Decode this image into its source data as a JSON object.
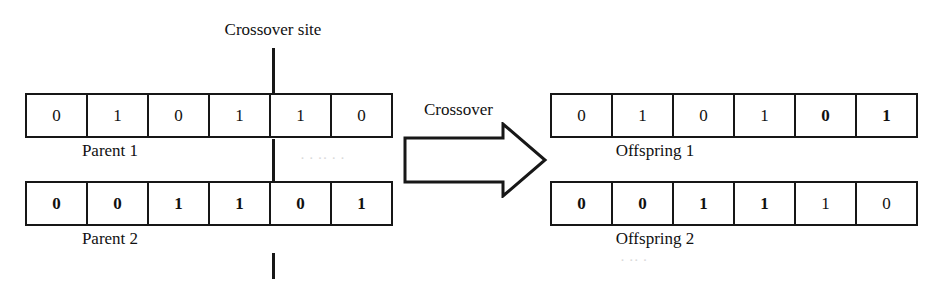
{
  "figure": {
    "crossover_site_label": "Crossover site",
    "operator_label": "Crossover",
    "arrow_icon": "right-block-arrow-icon"
  },
  "parents": [
    {
      "name": "Parent 1",
      "label": "Parent 1",
      "genes": [
        {
          "value": "0",
          "bold": false
        },
        {
          "value": "1",
          "bold": false
        },
        {
          "value": "0",
          "bold": false
        },
        {
          "value": "1",
          "bold": false
        },
        {
          "value": "1",
          "bold": false
        },
        {
          "value": "0",
          "bold": false
        }
      ]
    },
    {
      "name": "Parent 2",
      "label": "Parent 2",
      "genes": [
        {
          "value": "0",
          "bold": true
        },
        {
          "value": "0",
          "bold": true
        },
        {
          "value": "1",
          "bold": true
        },
        {
          "value": "1",
          "bold": true
        },
        {
          "value": "0",
          "bold": true
        },
        {
          "value": "1",
          "bold": true
        }
      ]
    }
  ],
  "offspring": [
    {
      "name": "Offspring 1",
      "label": "Offspring 1",
      "genes": [
        {
          "value": "0",
          "bold": false
        },
        {
          "value": "1",
          "bold": false
        },
        {
          "value": "0",
          "bold": false
        },
        {
          "value": "1",
          "bold": false
        },
        {
          "value": "0",
          "bold": true
        },
        {
          "value": "1",
          "bold": true
        }
      ]
    },
    {
      "name": "Offspring 2",
      "label": "Offspring 2",
      "genes": [
        {
          "value": "0",
          "bold": true
        },
        {
          "value": "0",
          "bold": true
        },
        {
          "value": "1",
          "bold": true
        },
        {
          "value": "1",
          "bold": true
        },
        {
          "value": "1",
          "bold": false
        },
        {
          "value": "0",
          "bold": false
        }
      ]
    }
  ],
  "colors": {
    "ink": "#171717",
    "paper": "#ffffff"
  }
}
